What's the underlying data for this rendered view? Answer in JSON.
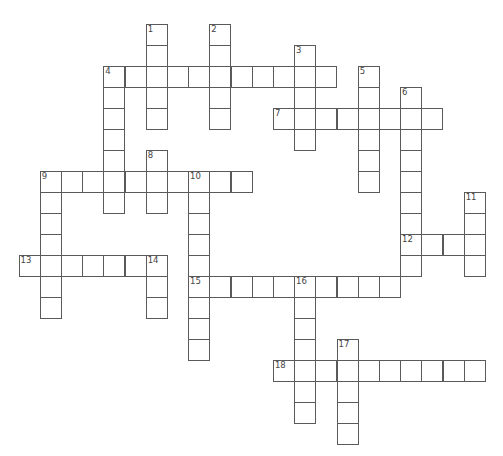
{
  "puzzle": {
    "type": "crossword",
    "grid": {
      "origin_x": 18.5,
      "origin_y": 24,
      "cell_w": 21.2,
      "cell_h": 21,
      "line_color": "#5a5a5a"
    },
    "entries": [
      {
        "number": "1",
        "direction": "down",
        "row": 0,
        "col": 6,
        "length": 5
      },
      {
        "number": "2",
        "direction": "down",
        "row": 0,
        "col": 9,
        "length": 5
      },
      {
        "number": "3",
        "direction": "down",
        "row": 1,
        "col": 13,
        "length": 5
      },
      {
        "number": "4",
        "direction": "across",
        "row": 2,
        "col": 4,
        "length": 11
      },
      {
        "number": "4",
        "direction": "down",
        "row": 2,
        "col": 4,
        "length": 7
      },
      {
        "number": "5",
        "direction": "down",
        "row": 2,
        "col": 16,
        "length": 6
      },
      {
        "number": "6",
        "direction": "down",
        "row": 3,
        "col": 18,
        "length": 9
      },
      {
        "number": "7",
        "direction": "across",
        "row": 4,
        "col": 12,
        "length": 8
      },
      {
        "number": "8",
        "direction": "down",
        "row": 6,
        "col": 6,
        "length": 3
      },
      {
        "number": "9",
        "direction": "across",
        "row": 7,
        "col": 1,
        "length": 10
      },
      {
        "number": "9",
        "direction": "down",
        "row": 7,
        "col": 1,
        "length": 7
      },
      {
        "number": "10",
        "direction": "down",
        "row": 7,
        "col": 8,
        "length": 9
      },
      {
        "number": "11",
        "direction": "down",
        "row": 8,
        "col": 21,
        "length": 4
      },
      {
        "number": "12",
        "direction": "across",
        "row": 10,
        "col": 18,
        "length": 4
      },
      {
        "number": "13",
        "direction": "across",
        "row": 11,
        "col": 0,
        "length": 7
      },
      {
        "number": "14",
        "direction": "down",
        "row": 11,
        "col": 6,
        "length": 3
      },
      {
        "number": "15",
        "direction": "across",
        "row": 12,
        "col": 8,
        "length": 10
      },
      {
        "number": "16",
        "direction": "down",
        "row": 12,
        "col": 13,
        "length": 7
      },
      {
        "number": "17",
        "direction": "down",
        "row": 15,
        "col": 15,
        "length": 5
      },
      {
        "number": "18",
        "direction": "across",
        "row": 16,
        "col": 12,
        "length": 10
      }
    ]
  }
}
